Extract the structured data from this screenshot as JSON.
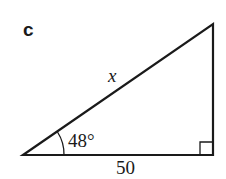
{
  "part_label": "c",
  "triangle": {
    "hypotenuse_label": "x",
    "angle_label": "48°",
    "base_label": "50",
    "right_angle": true,
    "stroke_color": "#1a1a1a"
  }
}
